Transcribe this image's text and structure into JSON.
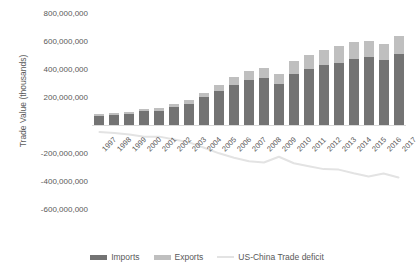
{
  "chart_data": {
    "type": "bar",
    "title": "",
    "xlabel": "",
    "ylabel": "Trade Value (thousands)",
    "categories": [
      "1997",
      "1998",
      "1999",
      "2000",
      "2001",
      "2002",
      "2003",
      "2004",
      "2005",
      "2006",
      "2007",
      "2008",
      "2009",
      "2010",
      "2011",
      "2012",
      "2013",
      "2014",
      "2015",
      "2016",
      "2017"
    ],
    "ylim": [
      -600000000,
      800000000
    ],
    "ytick_labels": [
      "800,000,000",
      "600,000,000",
      "400,000,000",
      "200,000,000",
      "-200,000,000",
      "-400,000,000",
      "-600,000,000"
    ],
    "ytick_values": [
      800000000,
      600000000,
      400000000,
      200000000,
      -200000000,
      -400000000,
      -600000000
    ],
    "grid": false,
    "legend_position": "bottom",
    "stacked": true,
    "series": [
      {
        "name": "Imports",
        "type": "bar",
        "color": "#737373",
        "values": [
          62557000,
          71169000,
          81788000,
          100018000,
          102278000,
          125193000,
          152436000,
          196682000,
          243470000,
          287774000,
          321443000,
          337773000,
          296374000,
          364953000,
          399371000,
          425619000,
          440430000,
          468475000,
          483202000,
          462420000,
          505470000
        ]
      },
      {
        "name": "Exports",
        "type": "bar",
        "color": "#bfbfbf",
        "values": [
          12862000,
          14241000,
          13111000,
          16185000,
          19182000,
          22128000,
          28368000,
          34428000,
          41192000,
          53673000,
          62937000,
          69733000,
          69497000,
          91911000,
          104122000,
          110516000,
          121721000,
          123657000,
          115873000,
          115594000,
          129894000
        ]
      },
      {
        "name": "US-China Trade deficit",
        "type": "line",
        "color": "#e3e3e3",
        "values": [
          -49695000,
          -56928000,
          -68677000,
          -83833000,
          -83096000,
          -103065000,
          -124068000,
          -162254000,
          -202278000,
          -234101000,
          -258506000,
          -268040000,
          -226877000,
          -273042000,
          -295249000,
          -315103000,
          -318709000,
          -344818000,
          -367329000,
          -346826000,
          -375576000
        ]
      }
    ]
  },
  "legend": {
    "items": [
      {
        "label": "Imports",
        "swatch": "bar-dark"
      },
      {
        "label": "Exports",
        "swatch": "bar-light"
      },
      {
        "label": "US-China Trade deficit",
        "swatch": "line-light"
      }
    ]
  },
  "axis": {
    "y_title": "Trade Value (thousands)"
  }
}
